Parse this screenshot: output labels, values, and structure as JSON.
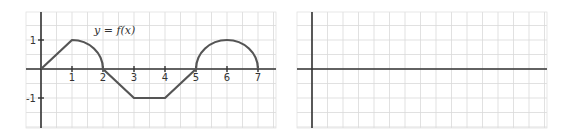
{
  "chart_data": [
    {
      "type": "line",
      "title": "",
      "annotation": "y = f(x)",
      "xlabel": "",
      "ylabel": "",
      "xlim": [
        -0.5,
        7.5
      ],
      "ylim": [
        -2,
        2
      ],
      "grid": true,
      "grid_step": 0.5,
      "x_ticks": [
        1,
        2,
        3,
        4,
        5,
        6,
        7
      ],
      "x_tick_labels": [
        "1",
        "2",
        "3",
        "4",
        "5",
        "6",
        "7"
      ],
      "y_ticks": [
        1,
        -1
      ],
      "y_tick_labels": [
        "1",
        "-1"
      ],
      "segments": [
        {
          "kind": "line",
          "from": [
            0,
            0
          ],
          "to": [
            1,
            1
          ]
        },
        {
          "kind": "quarter-circle",
          "center": [
            1,
            0
          ],
          "radius": 1,
          "from": [
            1,
            1
          ],
          "to": [
            2,
            0
          ]
        },
        {
          "kind": "line",
          "from": [
            2,
            0
          ],
          "to": [
            3,
            -1
          ]
        },
        {
          "kind": "line",
          "from": [
            3,
            -1
          ],
          "to": [
            4,
            -1
          ]
        },
        {
          "kind": "line",
          "from": [
            4,
            -1
          ],
          "to": [
            5,
            0
          ]
        },
        {
          "kind": "semicircle",
          "center": [
            6,
            0
          ],
          "radius": 1,
          "from": [
            5,
            0
          ],
          "to": [
            7,
            0
          ]
        }
      ],
      "x": [
        0,
        1,
        2,
        3,
        4,
        5,
        6,
        7
      ],
      "y": [
        0,
        1,
        0,
        -1,
        -1,
        0,
        1,
        0
      ]
    },
    {
      "type": "line",
      "title": "",
      "xlabel": "",
      "ylabel": "",
      "grid": true,
      "description": "blank coordinate grid with axes, no data plotted",
      "x": [],
      "y": []
    }
  ],
  "left_graph": {
    "label": "y = f(x)",
    "x_ticks": [
      "1",
      "2",
      "3",
      "4",
      "5",
      "6",
      "7"
    ],
    "y_ticks": [
      "1",
      "-1"
    ]
  },
  "right_graph": {
    "label": ""
  }
}
